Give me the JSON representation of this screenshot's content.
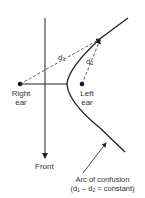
{
  "diagram": {
    "labels": {
      "right_ear_line1": "Right",
      "right_ear_line2": "ear",
      "left_ear_line1": "Left",
      "left_ear_line2": "ear",
      "front": "Front",
      "d1_main": "d",
      "d1_sub": "1",
      "d2_main": "d",
      "d2_sub": "2",
      "caption_line1": "Arc of confusion",
      "caption_line2_open": "(d",
      "caption_line2_sub1": "1",
      "caption_line2_mid": " – d",
      "caption_line2_sub2": "2",
      "caption_line2_close": " = constant)"
    },
    "colors": {
      "line": "#222222",
      "background": "#ffffff"
    }
  }
}
